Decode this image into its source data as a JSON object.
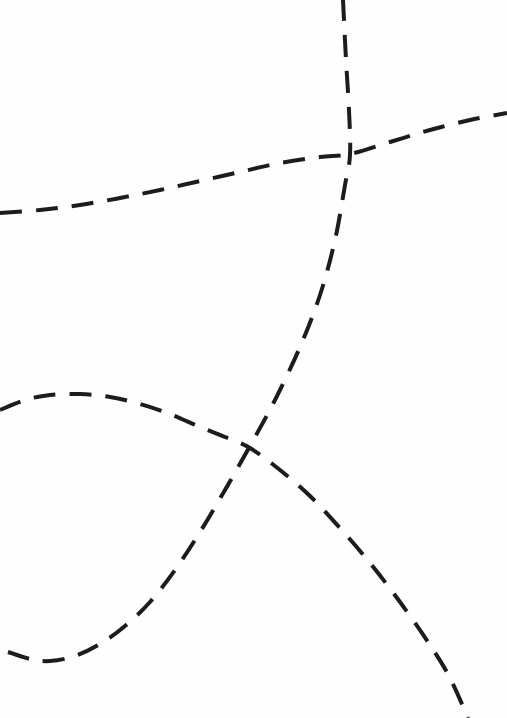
{
  "figure": {
    "title": "",
    "width": 507,
    "height": 718,
    "background_color": "#fefefe"
  },
  "chart_data": {
    "type": "line",
    "title": "",
    "subtitle": "",
    "xlabel": "",
    "ylabel": "",
    "xlim": [
      0,
      507
    ],
    "ylim": [
      0,
      718
    ],
    "grid": false,
    "axes_visible": false,
    "tick_labels_visible": false,
    "legend": {
      "visible": false,
      "position": "none",
      "entries": []
    },
    "annotations": [],
    "coordinate_note": "Pixel coordinates, origin at top-left of the 507x718 image; y increases downward",
    "series": [
      {
        "name": "shallow-rising-curve",
        "style": "dashed",
        "color": "#1c1c1c",
        "stroke_width": 4,
        "dash_length": 22,
        "gap_length": 14,
        "points": [
          [
            0,
            213
          ],
          [
            40,
            210
          ],
          [
            80,
            205
          ],
          [
            120,
            198
          ],
          [
            160,
            190
          ],
          [
            200,
            181
          ],
          [
            240,
            172
          ],
          [
            280,
            163
          ],
          [
            320,
            157
          ],
          [
            350,
            154
          ],
          [
            390,
            142
          ],
          [
            430,
            130
          ],
          [
            470,
            120
          ],
          [
            507,
            113
          ]
        ]
      },
      {
        "name": "steep-rising-curve",
        "style": "dashed",
        "color": "#1c1c1c",
        "stroke_width": 4,
        "dash_length": 22,
        "gap_length": 14,
        "points": [
          [
            8,
            652
          ],
          [
            30,
            659
          ],
          [
            50,
            661
          ],
          [
            75,
            656
          ],
          [
            100,
            644
          ],
          [
            125,
            626
          ],
          [
            150,
            602
          ],
          [
            175,
            570
          ],
          [
            200,
            532
          ],
          [
            225,
            490
          ],
          [
            250,
            446
          ],
          [
            275,
            400
          ],
          [
            300,
            347
          ],
          [
            320,
            295
          ],
          [
            335,
            240
          ],
          [
            345,
            185
          ],
          [
            350,
            155
          ],
          [
            349,
            110
          ],
          [
            346,
            60
          ],
          [
            343,
            0
          ]
        ]
      },
      {
        "name": "peaked-descending-curve",
        "style": "dashed",
        "color": "#1c1c1c",
        "stroke_width": 4,
        "dash_length": 22,
        "gap_length": 14,
        "points": [
          [
            0,
            410
          ],
          [
            25,
            400
          ],
          [
            50,
            395
          ],
          [
            80,
            394
          ],
          [
            110,
            397
          ],
          [
            140,
            404
          ],
          [
            170,
            414
          ],
          [
            200,
            427
          ],
          [
            225,
            437
          ],
          [
            250,
            448
          ],
          [
            280,
            470
          ],
          [
            310,
            496
          ],
          [
            340,
            528
          ],
          [
            370,
            563
          ],
          [
            400,
            602
          ],
          [
            430,
            645
          ],
          [
            450,
            678
          ],
          [
            468,
            718
          ]
        ]
      }
    ],
    "intersections": [
      {
        "name": "upper-crossing",
        "x": 350,
        "y": 155,
        "between": [
          "shallow-rising-curve",
          "steep-rising-curve"
        ]
      },
      {
        "name": "lower-crossing",
        "x": 250,
        "y": 447,
        "between": [
          "steep-rising-curve",
          "peaked-descending-curve"
        ]
      }
    ]
  }
}
